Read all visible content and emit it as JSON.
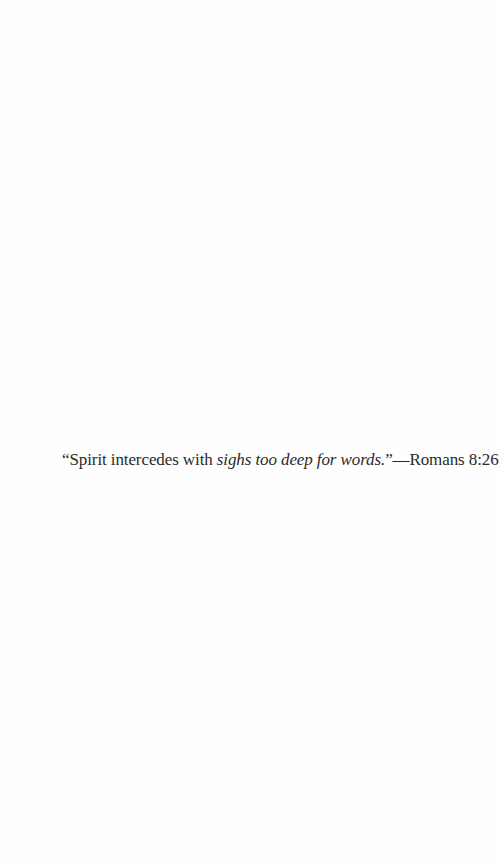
{
  "epigraph": {
    "quote_open": "“Spirit intercedes with ",
    "quote_italic": "sighs too deep for words.",
    "quote_close": "”",
    "dash": "—",
    "citation": "Romans 8:26"
  }
}
